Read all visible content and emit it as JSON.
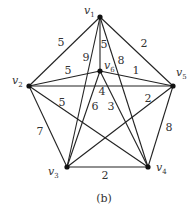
{
  "diagram": {
    "type": "weighted-graph",
    "caption": "(b)",
    "nodes": [
      {
        "id": "v1",
        "label": "v",
        "sub": "1",
        "x": 100,
        "y": 17,
        "lx": 84,
        "ly": 14
      },
      {
        "id": "v2",
        "label": "v",
        "sub": "2",
        "x": 29,
        "y": 86,
        "lx": 12,
        "ly": 84
      },
      {
        "id": "v3",
        "label": "v",
        "sub": "3",
        "x": 67,
        "y": 167,
        "lx": 48,
        "ly": 175
      },
      {
        "id": "v4",
        "label": "v",
        "sub": "4",
        "x": 148,
        "y": 167,
        "lx": 156,
        "ly": 171
      },
      {
        "id": "v5",
        "label": "v",
        "sub": "5",
        "x": 173,
        "y": 86,
        "lx": 176,
        "ly": 76
      },
      {
        "id": "v6",
        "label": "v",
        "sub": "6",
        "x": 100,
        "y": 71,
        "lx": 104,
        "ly": 69
      }
    ],
    "edges": [
      {
        "from": "v1",
        "to": "v2",
        "weight": "5",
        "wx": 61,
        "wy": 43
      },
      {
        "from": "v1",
        "to": "v5",
        "weight": "2",
        "wx": 144,
        "wy": 44
      },
      {
        "from": "v1",
        "to": "v6",
        "weight": "5",
        "wx": 104,
        "wy": 45
      },
      {
        "from": "v1",
        "to": "v3",
        "weight": "9",
        "wx": 86,
        "wy": 58
      },
      {
        "from": "v1",
        "to": "v4",
        "weight": "8",
        "wx": 121,
        "wy": 61
      },
      {
        "from": "v2",
        "to": "v6",
        "weight": "5",
        "wx": 68,
        "wy": 71
      },
      {
        "from": "v6",
        "to": "v5",
        "weight": "1",
        "wx": 136,
        "wy": 71
      },
      {
        "from": "v2",
        "to": "v5",
        "weight": "4",
        "wx": 102,
        "wy": 92
      },
      {
        "from": "v2",
        "to": "v4",
        "weight": "5",
        "wx": 62,
        "wy": 103
      },
      {
        "from": "v6",
        "to": "v3",
        "weight": "6",
        "wx": 95,
        "wy": 107
      },
      {
        "from": "v6",
        "to": "v4",
        "weight": "3",
        "wx": 111,
        "wy": 107
      },
      {
        "from": "v5",
        "to": "v3",
        "weight": "2",
        "wx": 148,
        "wy": 99
      },
      {
        "from": "v2",
        "to": "v3",
        "weight": "7",
        "wx": 40,
        "wy": 132
      },
      {
        "from": "v5",
        "to": "v4",
        "weight": "8",
        "wx": 169,
        "wy": 128
      },
      {
        "from": "v3",
        "to": "v4",
        "weight": "2",
        "wx": 105,
        "wy": 176
      }
    ]
  }
}
